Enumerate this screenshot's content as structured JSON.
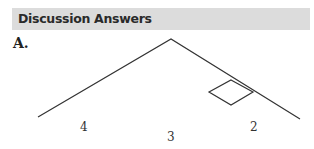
{
  "header": {
    "title": "Discussion Answers"
  },
  "section": {
    "label": "A."
  },
  "diagram": {
    "labels": [
      {
        "id": "4",
        "text": "4"
      },
      {
        "id": "3",
        "text": "3"
      },
      {
        "id": "2",
        "text": "2"
      }
    ],
    "line_color": "#333333"
  }
}
